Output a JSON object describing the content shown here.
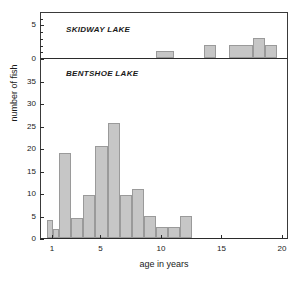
{
  "chart_data": {
    "type": "bar",
    "title": "",
    "xlabel": "age in years",
    "ylabel": "number of fish",
    "grid": false,
    "legend": "none",
    "xlim": [
      0,
      20.5
    ],
    "xticks": [
      1,
      5,
      10,
      15,
      20
    ],
    "xtick_labels": [
      "1",
      "5",
      "10",
      "15",
      "20"
    ],
    "panels": [
      {
        "name": "SKIDWAY LAKE",
        "ylim": [
          0,
          7
        ],
        "yticks": [
          0,
          5
        ],
        "ytick_labels": [
          "0",
          "5"
        ],
        "yminor": [
          1,
          2,
          3,
          4,
          6
        ],
        "bin_width": 1,
        "bins": [
          {
            "x0": 9.5,
            "x1": 11.0,
            "value": 1
          },
          {
            "x0": 13.5,
            "x1": 14.5,
            "value": 2
          },
          {
            "x0": 15.5,
            "x1": 17.5,
            "value": 2
          },
          {
            "x0": 17.5,
            "x1": 18.5,
            "value": 3
          },
          {
            "x0": 18.5,
            "x1": 19.5,
            "value": 2
          }
        ]
      },
      {
        "name": "BENTSHOE LAKE",
        "ylim": [
          0,
          40
        ],
        "yticks": [
          0,
          5,
          10,
          15,
          20,
          25,
          30,
          35
        ],
        "ytick_labels": [
          "0",
          "5",
          "10",
          "15",
          "20",
          "25",
          "30",
          "35"
        ],
        "yminor": [],
        "bin_width": 1,
        "bins": [
          {
            "x0": 0.5,
            "x1": 1.0,
            "value": 4
          },
          {
            "x0": 1.0,
            "x1": 1.5,
            "value": 2
          },
          {
            "x0": 1.5,
            "x1": 2.5,
            "value": 19
          },
          {
            "x0": 2.5,
            "x1": 3.5,
            "value": 4.5
          },
          {
            "x0": 3.5,
            "x1": 4.5,
            "value": 9.5
          },
          {
            "x0": 4.5,
            "x1": 5.5,
            "value": 20.5
          },
          {
            "x0": 5.5,
            "x1": 6.5,
            "value": 25.5
          },
          {
            "x0": 6.5,
            "x1": 7.5,
            "value": 9.5
          },
          {
            "x0": 7.5,
            "x1": 8.5,
            "value": 11
          },
          {
            "x0": 8.5,
            "x1": 9.5,
            "value": 5
          },
          {
            "x0": 9.5,
            "x1": 10.5,
            "value": 2.5
          },
          {
            "x0": 10.5,
            "x1": 11.5,
            "value": 2.5
          },
          {
            "x0": 11.5,
            "x1": 12.5,
            "value": 5
          }
        ]
      }
    ],
    "colors": {
      "bar_fill": "#c6c6c6",
      "bar_stroke": "#9a9a9a",
      "axis": "#2b2b2b",
      "text": "#1a1a1a",
      "background": "#ffffff"
    }
  }
}
